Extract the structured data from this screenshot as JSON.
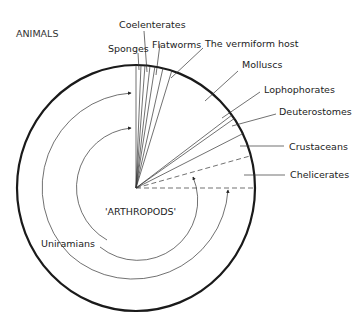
{
  "title": "ANIMALS",
  "center_label": "'ARTHROPODS'",
  "arc_label": "Uniramians",
  "groups": [
    {
      "label": "Sponges"
    },
    {
      "label": "Coelenterates"
    },
    {
      "label": "Flatworms"
    },
    {
      "label": "The vermiform host"
    },
    {
      "label": "Molluscs"
    },
    {
      "label": "Lophophorates"
    },
    {
      "label": "Deuterostomes"
    },
    {
      "label": "Crustaceans"
    },
    {
      "label": "Chelicerates"
    }
  ],
  "colors": {
    "stroke": "#222222",
    "outer_ring": "#1a1a1a",
    "text": "#222222"
  }
}
